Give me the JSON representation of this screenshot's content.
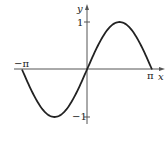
{
  "chart_data": {
    "type": "line",
    "title": "",
    "function": "y = sin(x)",
    "xlabel": "x",
    "ylabel": "y",
    "xlim": [
      -3.1416,
      3.1416
    ],
    "ylim": [
      -1,
      1
    ],
    "x_ticks": [
      {
        "value": -3.1416,
        "label": "−π"
      },
      {
        "value": 3.1416,
        "label": "π"
      }
    ],
    "y_ticks": [
      {
        "value": 1,
        "label": "1"
      },
      {
        "value": -1,
        "label": "−1"
      }
    ],
    "grid": false,
    "legend": null,
    "series": [
      {
        "name": "sin(x)",
        "x": [
          -3.1416,
          -2.3562,
          -1.5708,
          -0.7854,
          0,
          0.7854,
          1.5708,
          2.3562,
          3.1416
        ],
        "values": [
          0,
          -0.7071,
          -1,
          -0.7071,
          0,
          0.7071,
          1,
          0.7071,
          0
        ]
      }
    ]
  },
  "axes": {
    "x_axis_label": "x",
    "y_axis_label": "y",
    "x_neg_pi_label": "−π",
    "x_pi_label": "π",
    "y_one_label": "1",
    "y_neg_one_label": "−1"
  },
  "colors": {
    "curve": "#222222",
    "axis": "#555555",
    "background": "#ffffff"
  }
}
